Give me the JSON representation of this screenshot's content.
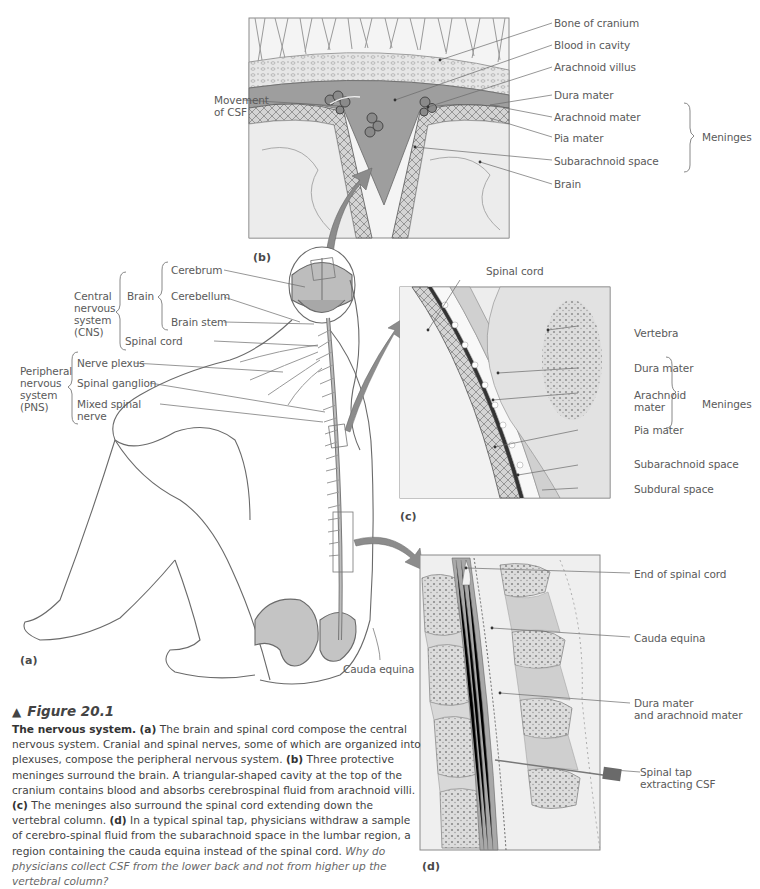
{
  "figure": {
    "number_label": "Figure 20.1",
    "marker_icon": "triangle-up",
    "caption": {
      "title": "The nervous system.",
      "a_tag": "(a)",
      "a_text": " The brain and spinal cord compose the central nervous system. Cranial and spinal nerves, some of which are organized into plexuses, compose the peripheral nervous system. ",
      "b_tag": "(b)",
      "b_text": " Three protective meninges surround the brain. A triangular-shaped cavity at the top of the cranium contains blood and absorbs cerebrospinal fluid from arachnoid villi. ",
      "c_tag": "(c)",
      "c_text": " The meninges also surround the spinal cord extending down the vertebral column. ",
      "d_tag": "(d)",
      "d_text": " In a typical spinal tap, physicians withdraw a sample of cerebro-spinal fluid from the subarachnoid space in the lumbar region, a region containing the cauda equina instead of the spinal cord. ",
      "question": "Why do physicians collect CSF from the lower back and not from higher up the vertebral column?"
    }
  },
  "panels": {
    "a": {
      "tag": "(a)",
      "groups": {
        "cns": "Central\nnervous\nsystem\n(CNS)",
        "brain": "Brain",
        "pns": "Peripheral\nnervous\nsystem\n(PNS)"
      },
      "labels": {
        "cerebrum": "Cerebrum",
        "cerebellum": "Cerebellum",
        "brain_stem": "Brain stem",
        "spinal_cord": "Spinal cord",
        "nerve_plexus": "Nerve plexus",
        "spinal_ganglion": "Spinal ganglion",
        "mixed_spinal_nerve": "Mixed spinal\nnerve",
        "cauda_equina": "Cauda equina"
      }
    },
    "b": {
      "tag": "(b)",
      "labels": {
        "movement_of_csf": "Movement\nof CSF",
        "bone_of_cranium": "Bone of cranium",
        "blood_in_cavity": "Blood in cavity",
        "arachnoid_villus": "Arachnoid villus",
        "dura_mater": "Dura mater",
        "arachnoid_mater": "Arachnoid mater",
        "pia_mater": "Pia mater",
        "subarachnoid_space": "Subarachnoid space",
        "brain": "Brain",
        "meninges": "Meninges"
      }
    },
    "c": {
      "tag": "(c)",
      "labels": {
        "spinal_cord": "Spinal cord",
        "vertebra": "Vertebra",
        "dura_mater": "Dura mater",
        "arachnoid_mater": "Arachnoid\nmater",
        "pia_mater": "Pia mater",
        "subarachnoid_space": "Subarachnoid space",
        "subdural_space": "Subdural space",
        "meninges": "Meninges"
      }
    },
    "d": {
      "tag": "(d)",
      "labels": {
        "end_of_spinal_cord": "End of spinal cord",
        "cauda_equina": "Cauda equina",
        "dura_arachnoid": "Dura mater\nand arachnoid mater",
        "spinal_tap": "Spinal tap\nextracting CSF"
      }
    }
  },
  "colors": {
    "line": "#6a6a6a",
    "panel_border": "#8a8a8a",
    "blood": "#9a9a9a",
    "tissue": "#c8c8c8",
    "arrow": "#8c8c8c"
  }
}
